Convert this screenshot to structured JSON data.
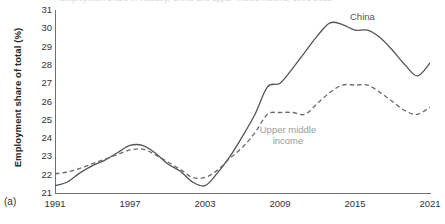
{
  "figure": {
    "panel_label": "(a)",
    "clipped_title": "Employment share in industry, China and upper middle income, 1991-2021",
    "ylabel": "Employment share of total (%)"
  },
  "labels": {
    "china": "China",
    "upper_middle_income_line1": "Upper middle",
    "upper_middle_income_line2": "income"
  },
  "colors": {
    "china_line": "#555555",
    "umi_line": "#6b6b6b",
    "axis": "#6f6f6f",
    "annotation": "#9a9a9a",
    "background": "#ffffff"
  },
  "chart_data": {
    "type": "line",
    "title": "",
    "xlabel": "",
    "ylabel": "Employment share of total (%)",
    "xlim": [
      1991,
      2021
    ],
    "ylim": [
      21,
      31
    ],
    "xticks": [
      1991,
      1997,
      2003,
      2009,
      2015,
      2021
    ],
    "yticks": [
      21,
      22,
      23,
      24,
      25,
      26,
      27,
      28,
      29,
      30,
      31
    ],
    "grid": false,
    "legend_position": "inline-annotations",
    "x": [
      1991,
      1992,
      1993,
      1994,
      1995,
      1996,
      1997,
      1998,
      1999,
      2000,
      2001,
      2002,
      2003,
      2004,
      2005,
      2006,
      2007,
      2008,
      2009,
      2010,
      2011,
      2012,
      2013,
      2014,
      2015,
      2016,
      2017,
      2018,
      2019,
      2020,
      2021
    ],
    "series": [
      {
        "name": "China",
        "style": "solid",
        "color": "#555555",
        "values": [
          21.4,
          21.6,
          22.1,
          22.5,
          22.8,
          23.2,
          23.6,
          23.6,
          23.2,
          22.6,
          22.2,
          21.6,
          21.4,
          22.1,
          23.0,
          24.1,
          25.3,
          26.8,
          27.0,
          27.8,
          28.7,
          29.6,
          30.3,
          30.2,
          29.9,
          29.9,
          29.5,
          28.8,
          28.0,
          27.4,
          28.1
        ]
      },
      {
        "name": "Upper middle income",
        "style": "dashed",
        "color": "#6b6b6b",
        "values": [
          22.05,
          22.15,
          22.35,
          22.6,
          22.85,
          23.1,
          23.35,
          23.4,
          23.1,
          22.7,
          22.3,
          21.85,
          21.85,
          22.25,
          22.9,
          23.5,
          24.3,
          25.3,
          25.4,
          25.4,
          25.3,
          25.9,
          26.5,
          26.9,
          26.9,
          26.9,
          26.5,
          26.0,
          25.5,
          25.3,
          25.7
        ]
      }
    ]
  }
}
